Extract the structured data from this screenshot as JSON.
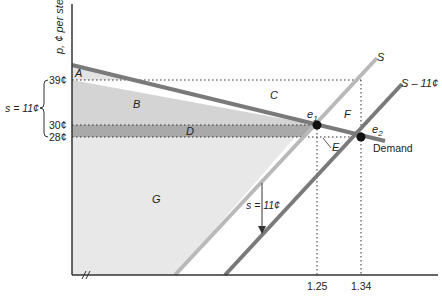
{
  "diagram": {
    "y_axis_label": "p, ¢ per stem",
    "price_ticks": [
      "39¢",
      "30¢",
      "28¢"
    ],
    "subsidy_brace_label": "s = 11¢",
    "x_ticks": [
      "1.25",
      "1.34"
    ],
    "area_labels": [
      "A",
      "B",
      "C",
      "D",
      "E",
      "F",
      "G"
    ],
    "curves": {
      "supply": "S",
      "supply_shifted": "S – 11¢",
      "demand": "Demand"
    },
    "equilibria": {
      "e1": "e",
      "e1_sub": "1",
      "e2": "e",
      "e2_sub": "2"
    },
    "shift_arrow_label": "s = 11¢",
    "colors": {
      "light_area": "#e6e6e6",
      "mid_area": "#cfcfcf",
      "dark_band": "#a9a9a9",
      "supply_line": "#b9b9b9",
      "shifted_line": "#7a7a7a",
      "demand_line": "#7a7a7a",
      "axis": "#333333"
    }
  }
}
